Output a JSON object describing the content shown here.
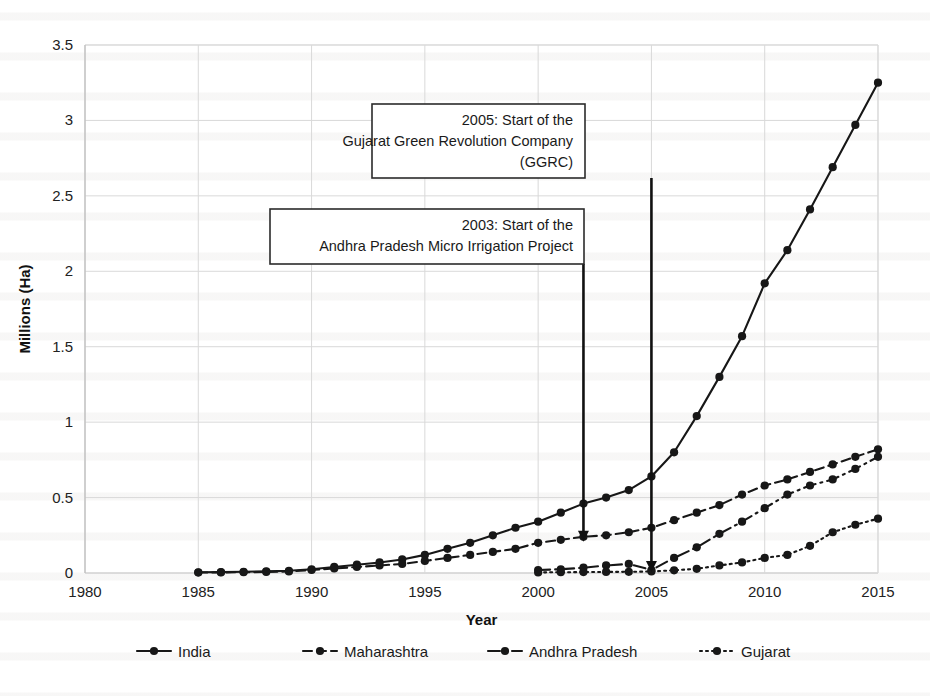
{
  "chart_data": {
    "type": "line",
    "title": "",
    "xlabel": "Year",
    "ylabel": "Millions (Ha)",
    "xlim": [
      1980,
      2015
    ],
    "ylim": [
      0,
      3.5
    ],
    "xticks": [
      1980,
      1985,
      1990,
      1995,
      2000,
      2005,
      2010,
      2015
    ],
    "yticks": [
      0,
      0.5,
      1,
      1.5,
      2,
      2.5,
      3,
      3.5
    ],
    "grid": true,
    "legend_position": "bottom",
    "x": [
      1985,
      1986,
      1987,
      1988,
      1989,
      1990,
      1991,
      1992,
      1993,
      1994,
      1995,
      1996,
      1997,
      1998,
      1999,
      2000,
      2001,
      2002,
      2003,
      2004,
      2005,
      2006,
      2007,
      2008,
      2009,
      2010,
      2011,
      2012,
      2013,
      2014,
      2015
    ],
    "series": [
      {
        "name": "India",
        "linestyle": "solid",
        "values": [
          0.005,
          0.006,
          0.008,
          0.011,
          0.015,
          0.025,
          0.04,
          0.055,
          0.07,
          0.09,
          0.12,
          0.16,
          0.2,
          0.25,
          0.3,
          0.34,
          0.4,
          0.46,
          0.5,
          0.55,
          0.64,
          0.8,
          1.04,
          1.3,
          1.57,
          1.92,
          2.14,
          2.41,
          2.69,
          2.97,
          3.25
        ]
      },
      {
        "name": "Maharashtra",
        "linestyle": "dashed",
        "values": [
          0.003,
          0.004,
          0.005,
          0.007,
          0.01,
          0.02,
          0.03,
          0.04,
          0.05,
          0.06,
          0.08,
          0.1,
          0.12,
          0.14,
          0.16,
          0.2,
          0.22,
          0.24,
          0.25,
          0.27,
          0.3,
          0.35,
          0.4,
          0.45,
          0.52,
          0.58,
          0.62,
          0.67,
          0.72,
          0.77,
          0.82
        ]
      },
      {
        "name": "Andhra Pradesh",
        "linestyle": "dashdot",
        "values": [
          null,
          null,
          null,
          null,
          null,
          null,
          null,
          null,
          null,
          null,
          null,
          null,
          null,
          null,
          null,
          0.02,
          0.025,
          0.035,
          0.05,
          0.06,
          0.02,
          0.1,
          0.17,
          0.26,
          0.34,
          0.43,
          0.52,
          0.58,
          0.62,
          0.69,
          0.77
        ]
      },
      {
        "name": "Gujarat",
        "linestyle": "dotted",
        "values": [
          null,
          null,
          null,
          null,
          null,
          null,
          null,
          null,
          null,
          null,
          null,
          null,
          null,
          null,
          null,
          0.004,
          0.005,
          0.006,
          0.007,
          0.008,
          0.01,
          0.018,
          0.028,
          0.05,
          0.07,
          0.1,
          0.12,
          0.18,
          0.27,
          0.32,
          0.36
        ]
      }
    ],
    "annotations": [
      {
        "id": "ggrc",
        "lines": [
          "2005: Start of the",
          "Gujarat Green Revolution Company",
          "(GGRC)"
        ],
        "target_year": 2005,
        "target_value": 0.02
      },
      {
        "id": "apmip",
        "lines": [
          "2003: Start of the",
          "Andhra Pradesh Micro Irrigation Project"
        ],
        "target_year": 2002,
        "target_value": 0.22
      }
    ]
  },
  "legend": {
    "items": [
      {
        "label": "India"
      },
      {
        "label": "Maharashtra"
      },
      {
        "label": "Andhra Pradesh"
      },
      {
        "label": "Gujarat"
      }
    ]
  },
  "axes": {
    "x_title": "Year",
    "y_title": "Millions (Ha)",
    "x_tick_labels": [
      "1980",
      "1985",
      "1990",
      "1995",
      "2000",
      "2005",
      "2010",
      "2015"
    ],
    "y_tick_labels": [
      "0",
      "0.5",
      "1",
      "1.5",
      "2",
      "2.5",
      "3",
      "3.5"
    ]
  },
  "annotation_boxes": {
    "ggrc": {
      "line1": "2005: Start of the",
      "line2": "Gujarat Green Revolution Company",
      "line3": "(GGRC)"
    },
    "apmip": {
      "line1": "2003: Start of the",
      "line2": "Andhra Pradesh Micro Irrigation Project"
    }
  },
  "colors": {
    "ink": "#171717",
    "grid": "#d9d9d9",
    "background": "#ffffff"
  }
}
